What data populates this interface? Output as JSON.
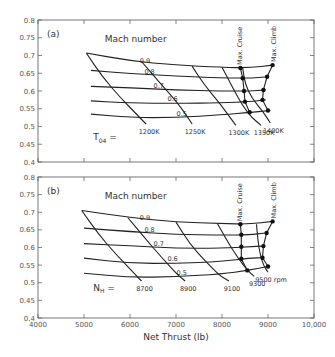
{
  "chart_data": [
    {
      "type": "line",
      "panel_label": "(a)",
      "xlabel": "",
      "ylabel": "",
      "xlim": [
        4000,
        10000
      ],
      "ylim": [
        0.4,
        0.8
      ],
      "yticks": [
        "0.4",
        "0.45",
        "0.5",
        "0.55",
        "0.6",
        "0.65",
        "0.7",
        "0.75",
        "0.8"
      ],
      "xticks": [
        4000,
        5000,
        6000,
        7000,
        8000,
        9000,
        10000
      ],
      "family_title": "Mach number",
      "series_mach": [
        {
          "name": "0.9",
          "label": "0.9",
          "points": [
            [
              5050,
              0.707
            ],
            [
              6000,
              0.685
            ],
            [
              7000,
              0.673
            ],
            [
              8000,
              0.667
            ],
            [
              8600,
              0.665
            ],
            [
              9100,
              0.673
            ]
          ]
        },
        {
          "name": "0.8",
          "label": "0.8",
          "points": [
            [
              5150,
              0.658
            ],
            [
              6000,
              0.649
            ],
            [
              7000,
              0.642
            ],
            [
              8000,
              0.637
            ],
            [
              8600,
              0.636
            ],
            [
              9000,
              0.64
            ]
          ]
        },
        {
          "name": "0.7",
          "label": "0.7",
          "points": [
            [
              5150,
              0.613
            ],
            [
              6000,
              0.609
            ],
            [
              7000,
              0.603
            ],
            [
              8000,
              0.6
            ],
            [
              8600,
              0.6
            ],
            [
              8950,
              0.603
            ]
          ]
        },
        {
          "name": "0.6",
          "label": "0.6",
          "points": [
            [
              5150,
              0.572
            ],
            [
              6000,
              0.566
            ],
            [
              7000,
              0.565
            ],
            [
              8000,
              0.567
            ],
            [
              8600,
              0.57
            ],
            [
              8950,
              0.575
            ]
          ]
        },
        {
          "name": "0.5",
          "label": "0.5",
          "points": [
            [
              5150,
              0.535
            ],
            [
              6000,
              0.525
            ],
            [
              7000,
              0.525
            ],
            [
              8000,
              0.533
            ],
            [
              8650,
              0.54
            ],
            [
              9050,
              0.545
            ]
          ]
        }
      ],
      "parameter_name": "T04 =",
      "series_param": [
        {
          "name": "1200K",
          "label": "1200K",
          "points": [
            [
              5050,
              0.707
            ],
            [
              5400,
              0.64
            ],
            [
              5800,
              0.58
            ],
            [
              6200,
              0.527
            ],
            [
              6350,
              0.507
            ]
          ]
        },
        {
          "name": "1250K",
          "label": "1250K",
          "points": [
            [
              6250,
              0.683
            ],
            [
              6600,
              0.63
            ],
            [
              7000,
              0.572
            ],
            [
              7250,
              0.527
            ],
            [
              7350,
              0.507
            ]
          ]
        },
        {
          "name": "1300K",
          "label": "1300K",
          "points": [
            [
              7350,
              0.67
            ],
            [
              7600,
              0.62
            ],
            [
              7950,
              0.565
            ],
            [
              8150,
              0.53
            ],
            [
              8300,
              0.503
            ]
          ]
        },
        {
          "name": "1350K",
          "label": "1350K",
          "points": [
            [
              8000,
              0.667
            ],
            [
              8250,
              0.605
            ],
            [
              8450,
              0.558
            ],
            [
              8650,
              0.525
            ],
            [
              8850,
              0.503
            ]
          ]
        },
        {
          "name": "1400K",
          "label": "1400K",
          "points": [
            [
              8450,
              0.665
            ],
            [
              8500,
              0.62
            ],
            [
              8650,
              0.58
            ],
            [
              8900,
              0.54
            ],
            [
              9050,
              0.51
            ]
          ]
        }
      ],
      "max_cruise": {
        "label": "Max. Cruise",
        "points": [
          [
            8400,
            0.665
          ],
          [
            8450,
            0.636
          ],
          [
            8480,
            0.6
          ],
          [
            8500,
            0.57
          ],
          [
            8600,
            0.54
          ]
        ]
      },
      "max_climb": {
        "label": "Max. Climb",
        "points": [
          [
            9100,
            0.673
          ],
          [
            8980,
            0.64
          ],
          [
            8900,
            0.603
          ],
          [
            8880,
            0.575
          ],
          [
            9000,
            0.545
          ]
        ]
      }
    },
    {
      "type": "line",
      "panel_label": "(b)",
      "xlabel": "Net Thrust (lb)",
      "ylabel": "",
      "xlim": [
        4000,
        10000
      ],
      "ylim": [
        0.4,
        0.8
      ],
      "yticks": [
        "0.4",
        "0.45",
        "0.5",
        "0.55",
        "0.6",
        "0.65",
        "0.7",
        "0.75",
        "0.8"
      ],
      "xticks": [
        4000,
        5000,
        6000,
        7000,
        8000,
        9000,
        10000
      ],
      "xticklabels": [
        "4000",
        "5000",
        "6000",
        "7000",
        "8000",
        "9000",
        "10,000"
      ],
      "family_title": "Mach number",
      "series_mach": [
        {
          "name": "0.9",
          "label": "0.9",
          "points": [
            [
              4950,
              0.705
            ],
            [
              6000,
              0.685
            ],
            [
              7000,
              0.672
            ],
            [
              8000,
              0.668
            ],
            [
              8600,
              0.666
            ],
            [
              9100,
              0.674
            ]
          ]
        },
        {
          "name": "0.8",
          "label": "0.8",
          "points": [
            [
              5000,
              0.655
            ],
            [
              6000,
              0.645
            ],
            [
              7000,
              0.637
            ],
            [
              8000,
              0.635
            ],
            [
              8600,
              0.636
            ],
            [
              8950,
              0.641
            ]
          ]
        },
        {
          "name": "0.7",
          "label": "0.7",
          "points": [
            [
              5000,
              0.611
            ],
            [
              6000,
              0.605
            ],
            [
              7000,
              0.598
            ],
            [
              8000,
              0.598
            ],
            [
              8600,
              0.602
            ],
            [
              8900,
              0.604
            ]
          ]
        },
        {
          "name": "0.6",
          "label": "0.6",
          "points": [
            [
              5000,
              0.57
            ],
            [
              6000,
              0.555
            ],
            [
              7000,
              0.555
            ],
            [
              8000,
              0.56
            ],
            [
              8600,
              0.57
            ],
            [
              8900,
              0.571
            ]
          ]
        },
        {
          "name": "0.5",
          "label": "0.5",
          "points": [
            [
              5000,
              0.527
            ],
            [
              6000,
              0.515
            ],
            [
              7000,
              0.517
            ],
            [
              8000,
              0.525
            ],
            [
              8550,
              0.535
            ],
            [
              9000,
              0.546
            ]
          ]
        }
      ],
      "parameter_name": "NH =",
      "series_param": [
        {
          "name": "8700",
          "label": "8700",
          "points": [
            [
              4950,
              0.705
            ],
            [
              5300,
              0.64
            ],
            [
              5700,
              0.58
            ],
            [
              6100,
              0.525
            ],
            [
              6250,
              0.505
            ]
          ]
        },
        {
          "name": "8900",
          "label": "8900",
          "points": [
            [
              5950,
              0.685
            ],
            [
              6300,
              0.63
            ],
            [
              6700,
              0.57
            ],
            [
              7050,
              0.52
            ],
            [
              7200,
              0.505
            ]
          ]
        },
        {
          "name": "9100",
          "label": "9100",
          "points": [
            [
              7000,
              0.672
            ],
            [
              7300,
              0.61
            ],
            [
              7650,
              0.56
            ],
            [
              7950,
              0.52
            ],
            [
              8150,
              0.505
            ]
          ]
        },
        {
          "name": "9300",
          "label": "9300",
          "points": [
            [
              7900,
              0.668
            ],
            [
              8150,
              0.61
            ],
            [
              8350,
              0.57
            ],
            [
              8550,
              0.535
            ],
            [
              8700,
              0.518
            ]
          ]
        },
        {
          "name": "9500 rpm",
          "label": "9500 rpm",
          "points": [
            [
              8750,
              0.666
            ],
            [
              8780,
              0.62
            ],
            [
              8830,
              0.58
            ],
            [
              8900,
              0.55
            ],
            [
              9000,
              0.53
            ]
          ]
        }
      ],
      "max_cruise": {
        "label": "Max. Cruise",
        "points": [
          [
            8400,
            0.666
          ],
          [
            8420,
            0.636
          ],
          [
            8420,
            0.602
          ],
          [
            8420,
            0.568
          ],
          [
            8550,
            0.535
          ]
        ]
      },
      "max_climb": {
        "label": "Max. Climb",
        "points": [
          [
            9100,
            0.674
          ],
          [
            8970,
            0.641
          ],
          [
            8900,
            0.604
          ],
          [
            8880,
            0.571
          ],
          [
            9000,
            0.546
          ]
        ]
      }
    }
  ]
}
